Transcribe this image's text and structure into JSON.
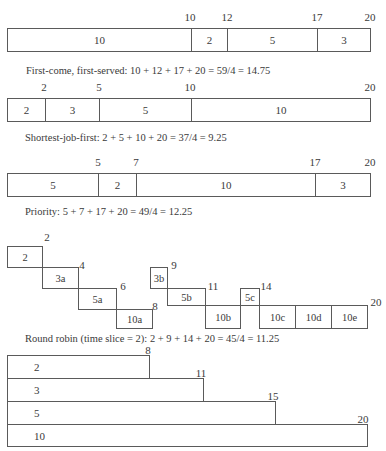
{
  "fcfs": {
    "ticks": [
      "10",
      "12",
      "17",
      "20"
    ],
    "segments": [
      "10",
      "2",
      "5",
      "3"
    ],
    "caption": "First-come, first-served: 10 + 12 + 17 + 20 = 59/4 = 14.75"
  },
  "sjf": {
    "ticks": [
      "2",
      "5",
      "10",
      "20"
    ],
    "segments": [
      "2",
      "3",
      "5",
      "10"
    ],
    "caption": "Shortest-job-first: 2 + 5 + 10 + 20 = 37/4 = 9.25"
  },
  "priority": {
    "ticks": [
      "5",
      "7",
      "17",
      "20"
    ],
    "segments": [
      "5",
      "2",
      "10",
      "3"
    ],
    "caption": "Priority: 5 + 7 + 17 + 20 = 49/4 = 12.25"
  },
  "round_robin": {
    "ticks": [
      "2",
      "4",
      "6",
      "8",
      "9",
      "11",
      "14",
      "20"
    ],
    "slices": [
      "2",
      "3a",
      "5a",
      "10a",
      "3b",
      "5b",
      "10b",
      "5c",
      "10c",
      "10d",
      "10e"
    ],
    "caption": "Round robin (time slice = 2): 2 + 9 + 14 + 20 = 45/4 = 11.25"
  },
  "completion_bars": {
    "rows": [
      {
        "label": "2",
        "end": "8"
      },
      {
        "label": "3",
        "end": "11"
      },
      {
        "label": "5",
        "end": "15"
      },
      {
        "label": "10",
        "end": "20"
      }
    ]
  }
}
